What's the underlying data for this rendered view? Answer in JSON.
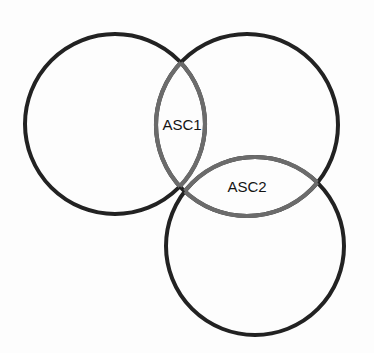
{
  "diagram": {
    "type": "venn",
    "circles": [
      {
        "id": "A",
        "cx": 115,
        "cy": 124,
        "r": 90
      },
      {
        "id": "B",
        "cx": 247,
        "cy": 125,
        "r": 91
      },
      {
        "id": "C",
        "cx": 255,
        "cy": 246,
        "r": 89
      }
    ],
    "labels": {
      "asc1": {
        "text": "ASC1",
        "x": 182,
        "y": 130
      },
      "asc2": {
        "text": "ASC2",
        "x": 247,
        "y": 192
      }
    },
    "colors": {
      "outer_stroke": "#222222",
      "inner_stroke": "#6b6b6b",
      "background": "#fdfdfd",
      "text": "#141414"
    }
  }
}
